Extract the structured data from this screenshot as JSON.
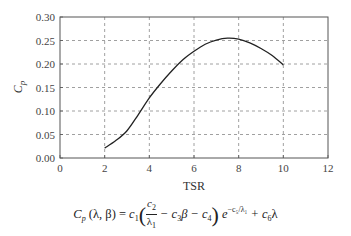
{
  "chart_data": {
    "type": "line",
    "title": "",
    "xlabel": "TSR",
    "ylabel": "Cp",
    "xlim": [
      0,
      12
    ],
    "ylim": [
      0,
      0.3
    ],
    "xticks": [
      0,
      2,
      4,
      6,
      8,
      10,
      12
    ],
    "xtick_labels": [
      "0",
      "2",
      "4",
      "6",
      "8",
      "10",
      "12"
    ],
    "yticks": [
      0.0,
      0.05,
      0.1,
      0.15,
      0.2,
      0.25,
      0.3
    ],
    "ytick_labels": [
      "0.00",
      "0.05",
      "0.10",
      "0.15",
      "0.20",
      "0.25",
      "0.30"
    ],
    "grid": true,
    "grid_style": "dashed",
    "legend": null,
    "series": [
      {
        "name": "Cp",
        "color": "#222222",
        "x": [
          2.0,
          2.5,
          3.0,
          3.5,
          4.0,
          4.5,
          5.0,
          5.5,
          6.0,
          6.5,
          7.0,
          7.5,
          8.0,
          8.5,
          9.0,
          9.5,
          10.0
        ],
        "y": [
          0.021,
          0.037,
          0.058,
          0.092,
          0.128,
          0.158,
          0.185,
          0.209,
          0.227,
          0.242,
          0.251,
          0.255,
          0.253,
          0.245,
          0.233,
          0.218,
          0.198
        ]
      }
    ],
    "caption_formula": "Cp (λ, β) = c1 (c2/λ1 − c3β − c4) e^(−c5/λ1) + c6λ"
  },
  "formula": {
    "lhs_symbol": "C",
    "lhs_sub": "p",
    "lhs_args": " (λ, β) = ",
    "c1": "c",
    "c1_sub": "1",
    "num": "c",
    "num_sub": "2",
    "den": "λ",
    "den_sub": "1",
    "mid": " − c",
    "mid_sub": "3",
    "mid2": "β − c",
    "mid2_sub": "4",
    "exp_base": " e",
    "exp_sup": "−c₅/λ₁",
    "tail": " + c",
    "tail_sub": "6",
    "tail_end": "λ"
  }
}
